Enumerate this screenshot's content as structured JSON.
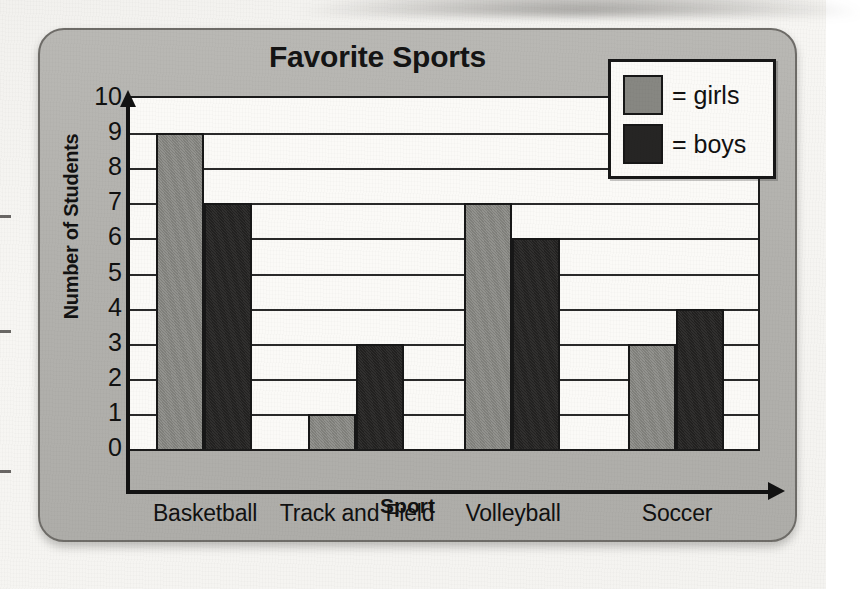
{
  "chart_data": {
    "type": "bar",
    "title": "Favorite Sports",
    "xlabel": "Sport",
    "ylabel": "Number of Students",
    "categories": [
      "Basketball",
      "Track and Field",
      "Volleyball",
      "Soccer"
    ],
    "series": [
      {
        "name": "girls",
        "values": [
          9,
          1,
          7,
          3
        ],
        "color": "#878782"
      },
      {
        "name": "boys",
        "values": [
          7,
          3,
          6,
          4
        ],
        "color": "#262524"
      }
    ],
    "ylim": [
      0,
      10
    ],
    "y_ticks": [
      10,
      9,
      8,
      7,
      6,
      5,
      4,
      3,
      2,
      1,
      0
    ],
    "grid": true,
    "legend_position": "top-right",
    "legend_entries": [
      {
        "label": "= girls",
        "swatch": "gray"
      },
      {
        "label": "= boys",
        "swatch": "black"
      }
    ]
  },
  "legend": {
    "girls_label": "= girls",
    "boys_label": "= boys"
  },
  "page": {
    "bleed_text_1": "hich team",
    "bleed_text_2": "difference between the",
    "bleed_text_3": "ys and gi"
  }
}
